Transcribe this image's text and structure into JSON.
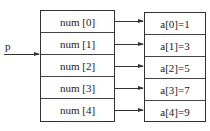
{
  "pointer": {
    "label": "p"
  },
  "left_array": {
    "cells": [
      "num [0]",
      "num [1]",
      "num [2]",
      "num [3]",
      "num [4]"
    ]
  },
  "right_array": {
    "cells": [
      "a[0]=1",
      "a[1]=3",
      "a[2]=5",
      "a[3]=7",
      "a[4]=9"
    ]
  }
}
